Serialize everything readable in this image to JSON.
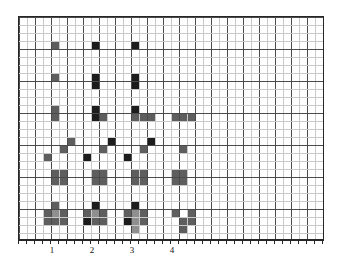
{
  "figure": {
    "background_color": "#ffffff",
    "plot": {
      "x": 18,
      "y": 16,
      "width": 306,
      "height": 224,
      "border_color": "#262626",
      "border_width": 1
    },
    "grid": {
      "columns": 38,
      "rows": 28,
      "cell_width": 8,
      "cell_height": 8,
      "minor_color": "#c9c9c9",
      "major_color": "#4a4a4a",
      "major_every_x": 2,
      "major_every_y": 4,
      "visible": true
    },
    "axis": {
      "line_color": "#262626",
      "tick_color": "#262626",
      "tick_length": 3,
      "tick_labels": [
        "1",
        "2",
        "3",
        "4"
      ],
      "tick_label_x": [
        52,
        92,
        132,
        172
      ],
      "tick_label_y": 245
    },
    "stray_mark": {
      "glyph": "·",
      "x": 208,
      "y": 63
    },
    "colors": {
      "dark": "#1c1c1c",
      "mid": "#5e5e5e",
      "light": "#8f8f8f"
    }
  },
  "chart_data": {
    "type": "heatmap",
    "title": "",
    "xlabel": "",
    "ylabel": "",
    "xlim": [
      0,
      38
    ],
    "ylim": [
      0,
      28
    ],
    "grid": true,
    "legend": "none",
    "categories": [
      "1",
      "2",
      "3",
      "4"
    ],
    "xtick_positions": [
      4.25,
      9.25,
      14.25,
      19.25
    ],
    "xtick_labels": [
      "1",
      "2",
      "3",
      "4"
    ],
    "value_levels": {
      "dark": 1.0,
      "mid": 0.62,
      "light": 0.38,
      "empty": 0.0
    },
    "cells": [
      {
        "col": 4,
        "row": 3,
        "shade": "mid"
      },
      {
        "col": 9,
        "row": 3,
        "shade": "dark"
      },
      {
        "col": 14,
        "row": 3,
        "shade": "dark"
      },
      {
        "col": 4,
        "row": 7,
        "shade": "mid"
      },
      {
        "col": 9,
        "row": 7,
        "shade": "dark"
      },
      {
        "col": 9,
        "row": 8,
        "shade": "dark"
      },
      {
        "col": 14,
        "row": 7,
        "shade": "dark"
      },
      {
        "col": 14,
        "row": 8,
        "shade": "dark"
      },
      {
        "col": 4,
        "row": 11,
        "shade": "mid"
      },
      {
        "col": 4,
        "row": 12,
        "shade": "mid"
      },
      {
        "col": 9,
        "row": 11,
        "shade": "dark"
      },
      {
        "col": 9,
        "row": 12,
        "shade": "dark"
      },
      {
        "col": 10,
        "row": 12,
        "shade": "mid"
      },
      {
        "col": 14,
        "row": 11,
        "shade": "dark"
      },
      {
        "col": 14,
        "row": 12,
        "shade": "mid"
      },
      {
        "col": 15,
        "row": 12,
        "shade": "mid"
      },
      {
        "col": 16,
        "row": 12,
        "shade": "mid"
      },
      {
        "col": 19,
        "row": 12,
        "shade": "mid"
      },
      {
        "col": 20,
        "row": 12,
        "shade": "mid"
      },
      {
        "col": 21,
        "row": 12,
        "shade": "mid"
      },
      {
        "col": 3,
        "row": 17,
        "shade": "mid"
      },
      {
        "col": 5,
        "row": 16,
        "shade": "mid"
      },
      {
        "col": 6,
        "row": 15,
        "shade": "mid"
      },
      {
        "col": 8,
        "row": 17,
        "shade": "dark"
      },
      {
        "col": 10,
        "row": 16,
        "shade": "mid"
      },
      {
        "col": 11,
        "row": 15,
        "shade": "dark"
      },
      {
        "col": 13,
        "row": 17,
        "shade": "dark"
      },
      {
        "col": 15,
        "row": 16,
        "shade": "mid"
      },
      {
        "col": 16,
        "row": 15,
        "shade": "dark"
      },
      {
        "col": 20,
        "row": 16,
        "shade": "mid"
      },
      {
        "col": 4,
        "row": 19,
        "shade": "mid"
      },
      {
        "col": 5,
        "row": 19,
        "shade": "mid"
      },
      {
        "col": 4,
        "row": 20,
        "shade": "mid"
      },
      {
        "col": 5,
        "row": 20,
        "shade": "mid"
      },
      {
        "col": 9,
        "row": 19,
        "shade": "mid"
      },
      {
        "col": 10,
        "row": 19,
        "shade": "mid"
      },
      {
        "col": 9,
        "row": 20,
        "shade": "mid"
      },
      {
        "col": 10,
        "row": 20,
        "shade": "mid"
      },
      {
        "col": 14,
        "row": 19,
        "shade": "mid"
      },
      {
        "col": 15,
        "row": 19,
        "shade": "mid"
      },
      {
        "col": 14,
        "row": 20,
        "shade": "mid"
      },
      {
        "col": 15,
        "row": 20,
        "shade": "mid"
      },
      {
        "col": 19,
        "row": 19,
        "shade": "mid"
      },
      {
        "col": 20,
        "row": 19,
        "shade": "mid"
      },
      {
        "col": 19,
        "row": 20,
        "shade": "mid"
      },
      {
        "col": 20,
        "row": 20,
        "shade": "mid"
      },
      {
        "col": 4,
        "row": 23,
        "shade": "mid"
      },
      {
        "col": 3,
        "row": 24,
        "shade": "mid"
      },
      {
        "col": 4,
        "row": 24,
        "shade": "light"
      },
      {
        "col": 5,
        "row": 24,
        "shade": "mid"
      },
      {
        "col": 3,
        "row": 25,
        "shade": "mid"
      },
      {
        "col": 4,
        "row": 25,
        "shade": "mid"
      },
      {
        "col": 5,
        "row": 25,
        "shade": "mid"
      },
      {
        "col": 9,
        "row": 23,
        "shade": "dark"
      },
      {
        "col": 8,
        "row": 24,
        "shade": "mid"
      },
      {
        "col": 9,
        "row": 24,
        "shade": "light"
      },
      {
        "col": 10,
        "row": 24,
        "shade": "mid"
      },
      {
        "col": 8,
        "row": 25,
        "shade": "dark"
      },
      {
        "col": 9,
        "row": 25,
        "shade": "mid"
      },
      {
        "col": 10,
        "row": 25,
        "shade": "mid"
      },
      {
        "col": 14,
        "row": 23,
        "shade": "dark"
      },
      {
        "col": 13,
        "row": 24,
        "shade": "mid"
      },
      {
        "col": 14,
        "row": 24,
        "shade": "light"
      },
      {
        "col": 15,
        "row": 24,
        "shade": "mid"
      },
      {
        "col": 13,
        "row": 25,
        "shade": "dark"
      },
      {
        "col": 14,
        "row": 25,
        "shade": "light"
      },
      {
        "col": 15,
        "row": 25,
        "shade": "mid"
      },
      {
        "col": 14,
        "row": 26,
        "shade": "light"
      },
      {
        "col": 19,
        "row": 24,
        "shade": "mid"
      },
      {
        "col": 21,
        "row": 24,
        "shade": "mid"
      },
      {
        "col": 20,
        "row": 25,
        "shade": "mid"
      },
      {
        "col": 21,
        "row": 25,
        "shade": "mid"
      },
      {
        "col": 20,
        "row": 26,
        "shade": "mid"
      }
    ]
  }
}
